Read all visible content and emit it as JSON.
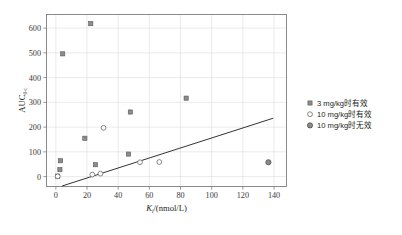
{
  "chart_data": {
    "type": "scatter",
    "title": "",
    "xlabel": "K_i/(nmol/L)",
    "xlabel_main": "K",
    "xlabel_sub": "i",
    "xlabel_rest": "/(nmol/L)",
    "ylabel": "AUC_0-t",
    "ylabel_main": "AUC",
    "ylabel_sub": "0-t",
    "xlim": [
      -6,
      148
    ],
    "ylim": [
      -40,
      655
    ],
    "xticks": [
      0,
      20,
      40,
      60,
      80,
      100,
      120,
      140
    ],
    "yticks": [
      0,
      100,
      200,
      300,
      400,
      500,
      600
    ],
    "grid": true,
    "legend_position": "right",
    "series": [
      {
        "name": "3 mg/kg时有效",
        "marker": "filled-square",
        "color": "#8b8b8b",
        "points": [
          {
            "x": 1.2,
            "y": 2
          },
          {
            "x": 2.6,
            "y": 28
          },
          {
            "x": 3.0,
            "y": 64
          },
          {
            "x": 4.4,
            "y": 496
          },
          {
            "x": 18.6,
            "y": 155
          },
          {
            "x": 22.4,
            "y": 618
          },
          {
            "x": 25.4,
            "y": 48
          },
          {
            "x": 46.6,
            "y": 91
          },
          {
            "x": 47.8,
            "y": 261
          },
          {
            "x": 83.6,
            "y": 317
          }
        ]
      },
      {
        "name": "10 mg/kg时有效",
        "marker": "open-circle",
        "color": "#ffffff",
        "points": [
          {
            "x": 1.2,
            "y": 1
          },
          {
            "x": 23.4,
            "y": 8
          },
          {
            "x": 28.6,
            "y": 12
          },
          {
            "x": 30.6,
            "y": 197
          },
          {
            "x": 54.0,
            "y": 58
          },
          {
            "x": 66.4,
            "y": 59
          }
        ]
      },
      {
        "name": "10 mg/kg时无效",
        "marker": "filled-circle",
        "color": "#8b8b8b",
        "points": [
          {
            "x": 136.4,
            "y": 58
          }
        ]
      }
    ],
    "trendline": {
      "x_start": 4.0,
      "y_start": -38,
      "x_end": 139.5,
      "y_end": 236
    }
  },
  "legend": {
    "items": [
      {
        "label": "3 mg/kg时有效",
        "marker": "filled-square"
      },
      {
        "label": "10 mg/kg时有效",
        "marker": "open-circle"
      },
      {
        "label": "10 mg/kg时无效",
        "marker": "filled-circle"
      }
    ]
  }
}
